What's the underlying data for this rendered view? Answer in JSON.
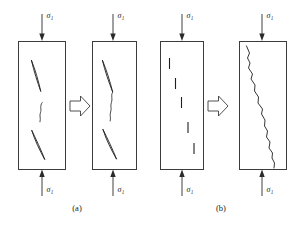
{
  "figure": {
    "stress_symbol": "σ",
    "stress_subscript": "1",
    "stroke_color": "#1f1f1f",
    "box_stroke_color": "#3c3c3c",
    "background_color": "#ffffff",
    "panels": [
      {
        "id": "a",
        "label": "(a)",
        "transition_icon": "block-right-arrow-icon",
        "specimens": [
          {
            "id": "a-before",
            "name": "specimen-a-initial",
            "top_load_label": "σ₁",
            "bottom_load_label": "σ₁",
            "feature_description": "three isolated en-echelon flaws",
            "feature_count": 3
          },
          {
            "id": "a-after",
            "name": "specimen-a-coalesced",
            "top_load_label": "σ₁",
            "bottom_load_label": "σ₁",
            "feature_description": "flaws linked by wing cracks into a continuous path",
            "feature_count": 1
          }
        ]
      },
      {
        "id": "b",
        "label": "(b)",
        "transition_icon": "block-right-arrow-icon",
        "specimens": [
          {
            "id": "b-before",
            "name": "specimen-b-initial",
            "top_load_label": "σ₁",
            "bottom_load_label": "σ₁",
            "feature_description": "five short vertical flaws in a diagonal array",
            "feature_count": 5
          },
          {
            "id": "b-after",
            "name": "specimen-b-coalesced",
            "top_load_label": "σ₁",
            "bottom_load_label": "σ₁",
            "feature_description": "single jagged through-going fracture",
            "feature_count": 1
          }
        ]
      }
    ]
  }
}
